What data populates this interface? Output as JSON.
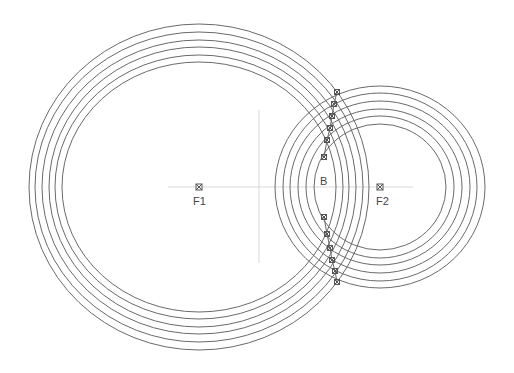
{
  "diagram": {
    "colors": {
      "circle": "#6a6a6a",
      "axis": "#d4d4d4",
      "marker": "#555555",
      "text": "#444444"
    },
    "foci": [
      {
        "label": "F1",
        "cx": 199,
        "cy": 187,
        "rx": [
          170,
          164,
          157,
          150,
          144,
          137
        ],
        "ry": [
          163,
          155,
          147,
          140,
          132,
          125
        ]
      },
      {
        "label": "F2",
        "cx": 380,
        "cy": 187,
        "rx": [
          105,
          97,
          90,
          82,
          74,
          66
        ],
        "ry": [
          101,
          94,
          86,
          78,
          71,
          63
        ]
      }
    ],
    "point_label": "B",
    "upper_points": [
      [
        337,
        92
      ],
      [
        334,
        104
      ],
      [
        332,
        116
      ],
      [
        330,
        128
      ],
      [
        327,
        140
      ],
      [
        324,
        157
      ]
    ],
    "lower_points": [
      [
        324,
        217
      ],
      [
        327,
        234
      ],
      [
        330,
        248
      ],
      [
        332,
        260
      ],
      [
        335,
        271
      ],
      [
        337,
        282
      ]
    ]
  }
}
